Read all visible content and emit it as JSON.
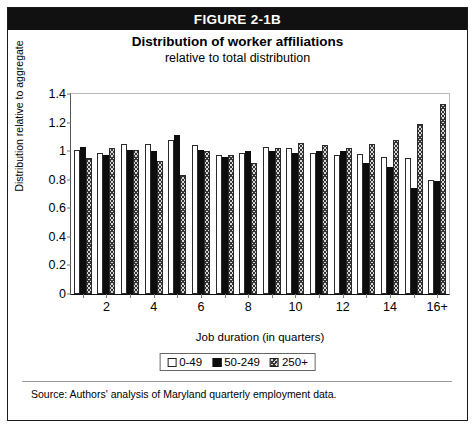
{
  "figure": {
    "header_label": "FIGURE 2-1B",
    "title": "Distribution of worker affiliations",
    "subtitle": "relative to total distribution",
    "source": "Source: Authors' analysis of Maryland quarterly employment data."
  },
  "chart_data": {
    "type": "bar",
    "title": "Distribution of worker affiliations",
    "subtitle": "relative to total distribution",
    "xlabel": "Job duration (in quarters)",
    "ylabel": "Distribution relative to aggregate",
    "ylim": [
      0,
      1.4
    ],
    "yticks": [
      0,
      0.2,
      0.4,
      0.6,
      0.8,
      1,
      1.2,
      1.4
    ],
    "ytick_labels": [
      "0",
      "0.2",
      "0.4",
      "0.6",
      "0.8",
      "1",
      "1.2",
      "1.4"
    ],
    "grid": false,
    "legend_position": "bottom",
    "categories": [
      "1",
      "2",
      "3",
      "4",
      "5",
      "6",
      "7",
      "8",
      "9",
      "10",
      "11",
      "12",
      "13",
      "14",
      "15",
      "16+"
    ],
    "xtick_labels": [
      "2",
      "4",
      "6",
      "8",
      "10",
      "12",
      "14",
      "16+"
    ],
    "xtick_categories": [
      "2",
      "4",
      "6",
      "8",
      "10",
      "12",
      "14",
      "16+"
    ],
    "series": [
      {
        "name": "0-49",
        "fill": "white",
        "values": [
          1.01,
          0.99,
          1.05,
          1.05,
          1.08,
          1.04,
          0.97,
          0.99,
          1.03,
          1.02,
          0.99,
          0.97,
          0.98,
          0.96,
          0.95,
          0.8
        ]
      },
      {
        "name": "50-249",
        "fill": "black",
        "values": [
          1.03,
          0.97,
          1.01,
          1.0,
          1.11,
          1.01,
          0.96,
          1.0,
          1.0,
          0.99,
          1.0,
          1.0,
          0.92,
          0.89,
          0.74,
          0.79
        ]
      },
      {
        "name": "250+",
        "fill": "hatched",
        "values": [
          0.95,
          1.02,
          1.01,
          0.93,
          0.83,
          1.0,
          0.97,
          0.92,
          1.02,
          1.06,
          1.04,
          1.02,
          1.05,
          1.08,
          1.19,
          1.33
        ]
      }
    ]
  },
  "legend": {
    "items": [
      {
        "label": "0-49"
      },
      {
        "label": "50-249"
      },
      {
        "label": "250+"
      }
    ]
  }
}
